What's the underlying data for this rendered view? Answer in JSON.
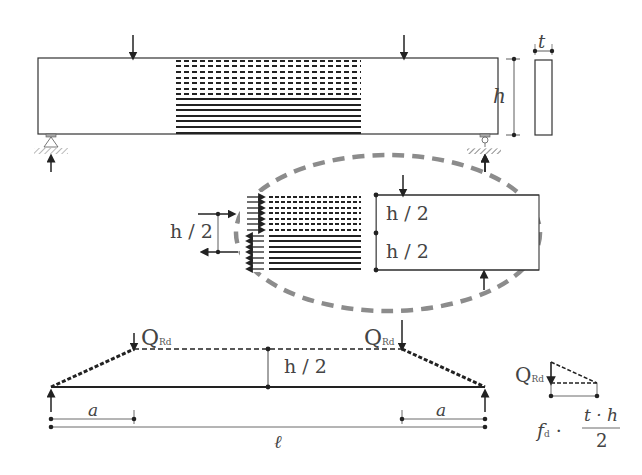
{
  "diagram": {
    "type": "structural-beam-shear-strut-model",
    "beam_elevation": {
      "labels": {
        "thickness": "t",
        "height": "h"
      },
      "supports": [
        "pin-left",
        "roller-right"
      ],
      "loads": [
        "point-load-left",
        "point-load-right"
      ]
    },
    "detail": {
      "upper_half": "h / 2",
      "lower_half": "h / 2",
      "lever_arm": "h / 2"
    },
    "truss_model": {
      "load_left": "Q",
      "load_left_sub": "Rd",
      "load_right": "Q",
      "load_right_sub": "Rd",
      "inner_height": "h / 2",
      "shear_span_left": "a",
      "shear_span_right": "a",
      "span": "ℓ"
    },
    "force_triangle": {
      "load": "Q",
      "load_sub": "Rd",
      "resistance_f": "f",
      "resistance_sub": "d",
      "dot": "·",
      "numerator": "t · h",
      "denominator": "2"
    },
    "colors": {
      "line": "#333333",
      "ellipse": "#8c8c8c",
      "hatch": "#888888"
    }
  }
}
